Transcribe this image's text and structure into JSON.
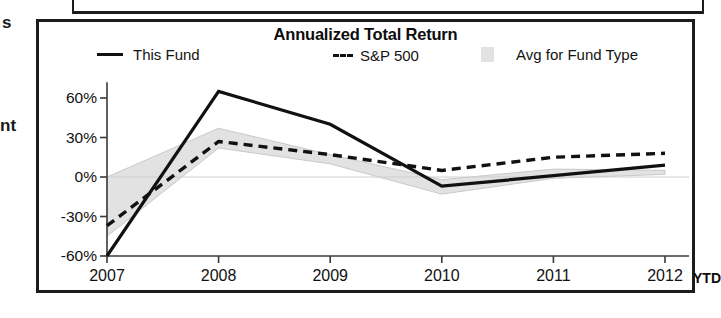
{
  "scan_fragments": {
    "top": "s",
    "middle": "nt"
  },
  "chart_data": {
    "type": "line",
    "title": "Annualized Total Return",
    "xlabel": "",
    "ylabel": "",
    "categories": [
      "2007",
      "2008",
      "2009",
      "2010",
      "2011",
      "2012"
    ],
    "x_axis_suffix": "YTD",
    "ytick_labels": [
      "60%",
      "30%",
      "0%",
      "-30%",
      "-60%"
    ],
    "ytick_values": [
      60,
      30,
      0,
      -30,
      -60
    ],
    "ylim": [
      -60,
      72
    ],
    "grid": false,
    "legend_position": "top",
    "series": [
      {
        "name": "This Fund",
        "style": "solid",
        "color": "#111111",
        "values": [
          -60,
          65,
          40,
          -7,
          1,
          9
        ]
      },
      {
        "name": "S&P 500",
        "style": "dashed",
        "color": "#111111",
        "values": [
          -37,
          27,
          17,
          5,
          15,
          18
        ]
      },
      {
        "name": "Avg for Fund Type",
        "style": "band",
        "color": "#e2e2e2",
        "band_upper": [
          0,
          37,
          17,
          -2,
          6,
          5
        ],
        "band_lower": [
          -45,
          22,
          10,
          -13,
          -1,
          2
        ]
      }
    ]
  },
  "legend": {
    "items": [
      {
        "label": "This Fund",
        "marker": "solid-line"
      },
      {
        "label": "S&P 500",
        "marker": "dashed-line"
      },
      {
        "label": "Avg for Fund Type",
        "marker": "gray-swatch"
      }
    ]
  }
}
